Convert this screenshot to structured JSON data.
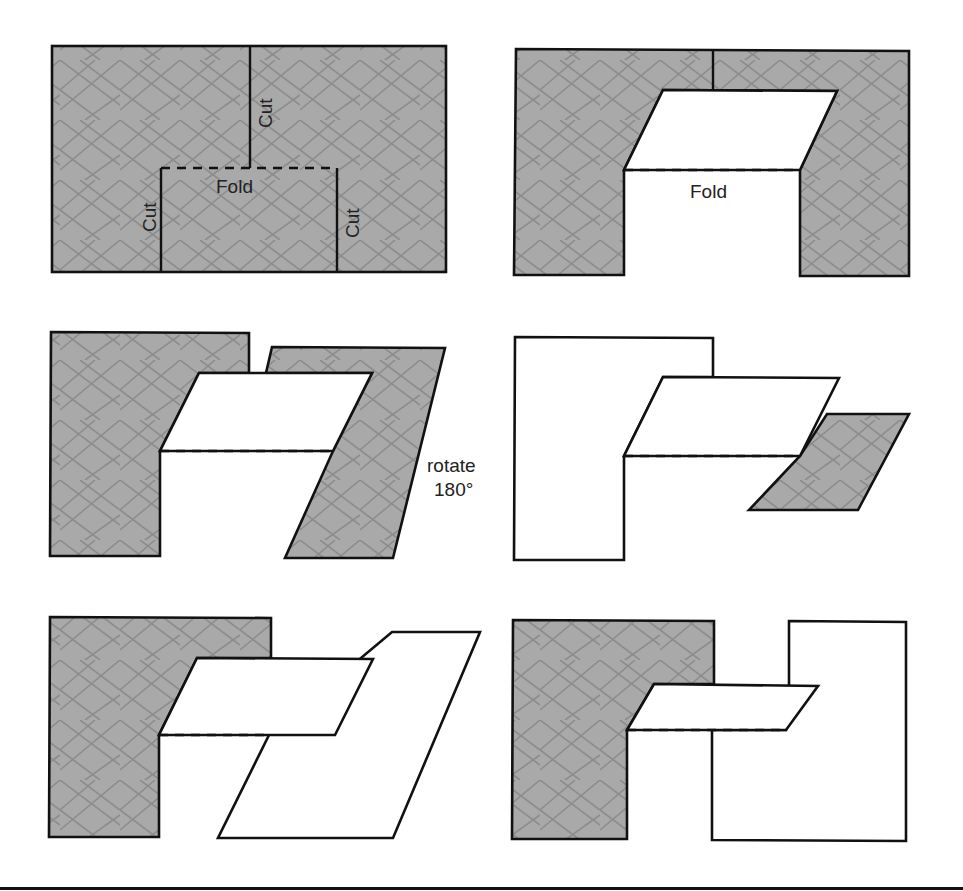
{
  "figure": {
    "colors": {
      "paper_gray": "#a9a9a9",
      "hatch_line": "#8a8a8a",
      "outline": "#111111",
      "background": "#ffffff"
    },
    "panels": [
      {
        "id": "step-1",
        "labels": {
          "cut_top": "Cut",
          "cut_left": "Cut",
          "cut_right": "Cut",
          "fold": "Fold"
        }
      },
      {
        "id": "step-2",
        "labels": {
          "fold": "Fold"
        }
      },
      {
        "id": "step-3",
        "labels": {
          "rotate_line1": "rotate",
          "rotate_line2": "180°"
        }
      },
      {
        "id": "step-4",
        "labels": {}
      },
      {
        "id": "step-5",
        "labels": {}
      },
      {
        "id": "step-6",
        "labels": {}
      }
    ]
  }
}
